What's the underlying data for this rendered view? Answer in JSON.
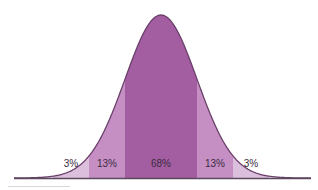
{
  "chart_data": {
    "type": "area",
    "title": "",
    "subtitle": "",
    "xlabel": "",
    "ylabel": "",
    "grid": false,
    "legend": null,
    "bands": [
      {
        "label": "",
        "value": null,
        "range_sd": [
          -3,
          -2
        ],
        "color": "#efe1ef"
      },
      {
        "label": "3%",
        "value": 3,
        "range_sd": [
          -2,
          -1.5
        ],
        "color": "#dcbfdc"
      },
      {
        "label": "13%",
        "value": 13,
        "range_sd": [
          -1.5,
          -1
        ],
        "color": "#c58fc4"
      },
      {
        "label": "68%",
        "value": 68,
        "range_sd": [
          -1,
          1
        ],
        "color": "#a35ea2"
      },
      {
        "label": "13%",
        "value": 13,
        "range_sd": [
          1,
          1.5
        ],
        "color": "#c58fc4"
      },
      {
        "label": "3%",
        "value": 3,
        "range_sd": [
          1.5,
          2
        ],
        "color": "#dcbfdc"
      },
      {
        "label": "",
        "value": null,
        "range_sd": [
          2,
          3
        ],
        "color": "#efe1ef"
      }
    ],
    "categories": [
      "3%",
      "13%",
      "68%",
      "13%",
      "3%"
    ],
    "values": [
      3,
      13,
      68,
      13,
      3
    ]
  },
  "colors": {
    "outline": "#6a3f6a",
    "baseline": "#5a4a5c",
    "label_text": "#3a2a3e"
  }
}
